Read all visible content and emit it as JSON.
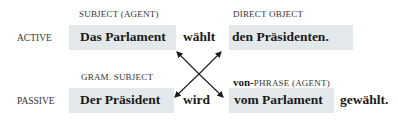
{
  "active": {
    "row_label": "ACTIVE",
    "subject_caption": "SUBJECT (AGENT)",
    "subject": "Das Parlament",
    "verb": "wählt",
    "object_caption": "DIRECT OBJECT",
    "object": "den Präsidenten."
  },
  "passive": {
    "row_label": "PASSIVE",
    "subject_caption": "GRAM. SUBJECT",
    "subject": "Der Präsident",
    "verb": "wird",
    "agent_caption_bold": "von-",
    "agent_caption": "PHRASE (AGENT)",
    "agent": "vom Parlament",
    "participle": "gewählt."
  },
  "colors": {
    "box_fill": "#e3e8ea",
    "arrow": "#1a1a1a"
  }
}
